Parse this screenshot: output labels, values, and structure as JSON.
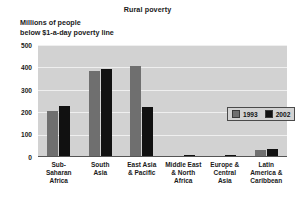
{
  "chart_data": {
    "type": "bar",
    "title": "Rural poverty",
    "ylabel_line1": "Millions of people",
    "ylabel_line2": "below $1-a-day poverty line",
    "xlabel": "",
    "ylim": [
      0,
      500
    ],
    "yticks": [
      500,
      400,
      300,
      200,
      100,
      0
    ],
    "ytick_labels": [
      "500",
      "400",
      "300",
      "200",
      "100",
      "0"
    ],
    "grid": true,
    "legend_position": "upper right inside plot",
    "categories": [
      "Sub-Saharan Africa",
      "South Asia",
      "East Asia & Pacific",
      "Middle East & North Africa",
      "Europe & Central Asia",
      "Latin America & Caribbean"
    ],
    "category_label_lines": [
      [
        "Sub-",
        "Saharan",
        "Africa"
      ],
      [
        "South",
        "Asia"
      ],
      [
        "East Asia",
        "& Pacific"
      ],
      [
        "Middle East",
        "& North",
        "Africa"
      ],
      [
        "Europe &",
        "Central",
        "Asia"
      ],
      [
        "Latin",
        "America &",
        "Caribbean"
      ]
    ],
    "series": [
      {
        "name": "1993",
        "color": "#6f6f6f",
        "values": [
          205,
          385,
          405,
          6,
          5,
          33
        ]
      },
      {
        "name": "2002",
        "color": "#111111",
        "values": [
          228,
          395,
          222,
          8,
          7,
          35
        ]
      }
    ]
  },
  "legend": {
    "entries": [
      {
        "label": "1993",
        "swatch": "gray-swatch-icon"
      },
      {
        "label": "2002",
        "swatch": "black-swatch-icon"
      }
    ]
  },
  "colors": {
    "plot_background": "#d2d2d2",
    "gridline": "#efefef",
    "axis": "#555555",
    "series_1993": "#6f6f6f",
    "series_2002": "#111111",
    "text": "#1a1a1a"
  }
}
